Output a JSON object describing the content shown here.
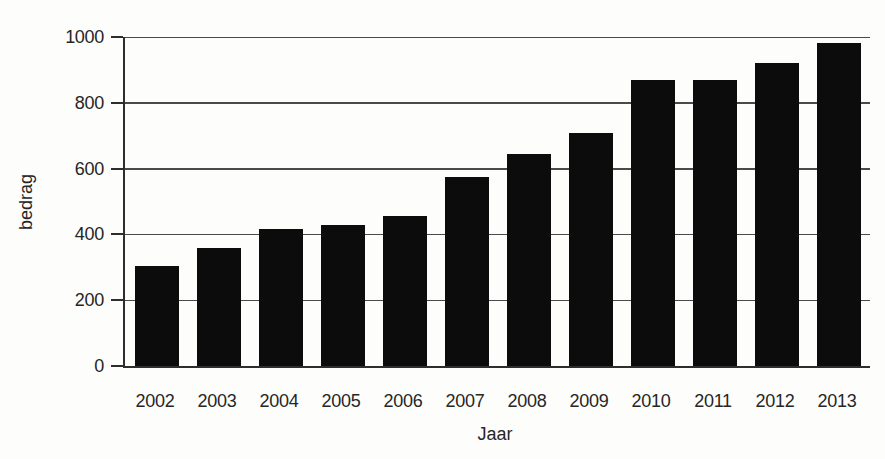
{
  "chart_data": {
    "type": "bar",
    "title": "",
    "categories": [
      "2002",
      "2003",
      "2004",
      "2005",
      "2006",
      "2007",
      "2008",
      "2009",
      "2010",
      "2011",
      "2012",
      "2013"
    ],
    "values": [
      305,
      360,
      417,
      430,
      457,
      575,
      643,
      707,
      870,
      870,
      920,
      983
    ],
    "xlabel": "Jaar",
    "ylabel": "bedrag",
    "ylim": [
      0,
      1000
    ],
    "y_ticks": [
      0,
      200,
      400,
      600,
      800,
      1000
    ],
    "grid": true,
    "legend": "none",
    "bar_color": "#0c0c0c",
    "grid_color": "#4a4a4a",
    "axis_color": "#2e2e2e",
    "text_color": "#262626"
  }
}
